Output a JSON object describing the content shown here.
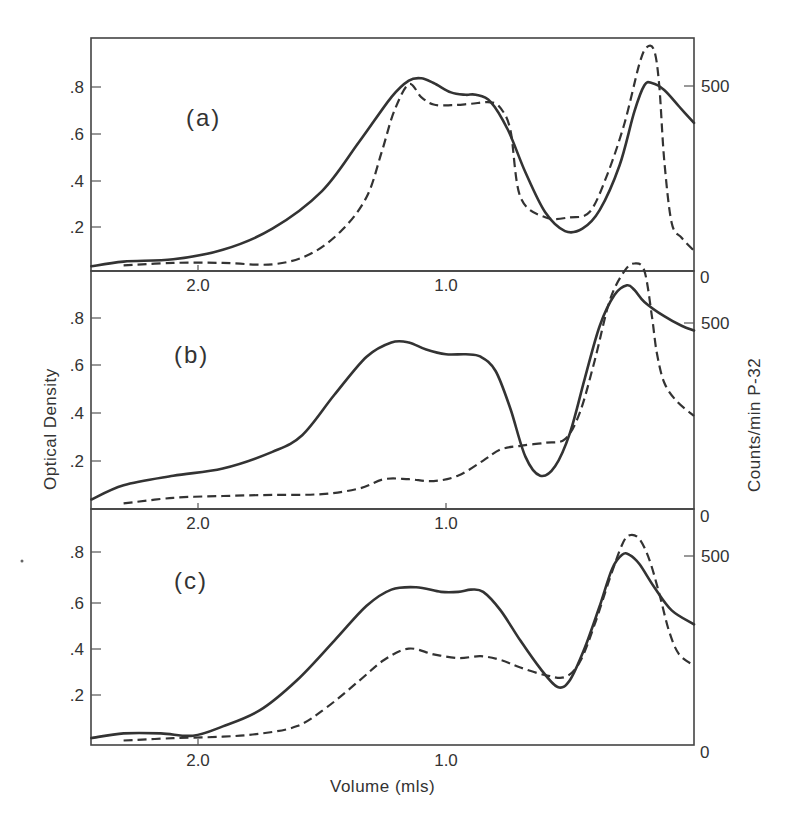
{
  "figure": {
    "y_axis_left_title": "Optical Density",
    "y_axis_right_title": "Counts/min  P-32",
    "x_axis_title": "Volume (mls)"
  },
  "panels": [
    {
      "label": "(a)",
      "left_ticks": [
        ".2",
        ".4",
        ".6",
        ".8"
      ],
      "right_ticks": [
        "0",
        "500"
      ],
      "x_ticks": [
        "2.0",
        "1.0"
      ]
    },
    {
      "label": "(b)",
      "left_ticks": [
        ".2",
        ".4",
        ".6",
        ".8"
      ],
      "right_ticks": [
        "0",
        "500"
      ],
      "x_ticks": [
        "2.0",
        "1.0"
      ]
    },
    {
      "label": "(c)",
      "left_ticks": [
        ".2",
        ".4",
        ".6",
        ".8"
      ],
      "right_ticks": [
        "0",
        "500"
      ],
      "x_ticks": [
        "2.0",
        "1.0"
      ]
    }
  ],
  "chart_data": [
    {
      "type": "line",
      "title": "(a)",
      "xlabel": "Volume (mls)",
      "ylabel": "Optical Density",
      "ylabel_right": "Counts/min P-32",
      "x_reversed": true,
      "xlim": [
        2.43,
        0.0
      ],
      "ylim": [
        0,
        0.99
      ],
      "ylim_right": [
        0,
        640
      ],
      "grid": false,
      "series": [
        {
          "name": "Optical Density (solid)",
          "axis": "left",
          "x": [
            2.43,
            2.3,
            2.1,
            1.9,
            1.7,
            1.5,
            1.35,
            1.22,
            1.15,
            1.1,
            1.05,
            0.98,
            0.92,
            0.88,
            0.82,
            0.75,
            0.68,
            0.6,
            0.52,
            0.45,
            0.38,
            0.3,
            0.24,
            0.2,
            0.17,
            0.12,
            0.06,
            0.0
          ],
          "y": [
            0.02,
            0.04,
            0.05,
            0.09,
            0.18,
            0.34,
            0.55,
            0.74,
            0.81,
            0.82,
            0.8,
            0.76,
            0.75,
            0.75,
            0.72,
            0.6,
            0.42,
            0.25,
            0.17,
            0.18,
            0.26,
            0.45,
            0.68,
            0.79,
            0.8,
            0.77,
            0.7,
            0.63
          ]
        },
        {
          "name": "Counts/min P-32 (dashed)",
          "axis": "right",
          "x": [
            2.3,
            2.1,
            1.9,
            1.7,
            1.55,
            1.42,
            1.32,
            1.26,
            1.21,
            1.15,
            1.1,
            1.05,
            0.98,
            0.9,
            0.82,
            0.78,
            0.74,
            0.7,
            0.6,
            0.5,
            0.42,
            0.35,
            0.28,
            0.22,
            0.19,
            0.16,
            0.14,
            0.12,
            0.09,
            0.05,
            0.0
          ],
          "y": [
            15,
            22,
            22,
            18,
            45,
            110,
            200,
            320,
            430,
            505,
            470,
            450,
            448,
            452,
            456,
            440,
            380,
            200,
            145,
            145,
            160,
            260,
            400,
            560,
            605,
            595,
            500,
            300,
            130,
            90,
            55
          ]
        }
      ]
    },
    {
      "type": "line",
      "title": "(b)",
      "xlabel": "Volume (mls)",
      "ylabel": "Optical Density",
      "ylabel_right": "Counts/min P-32",
      "x_reversed": true,
      "xlim": [
        2.43,
        0.0
      ],
      "ylim": [
        0,
        0.99
      ],
      "ylim_right": [
        0,
        640
      ],
      "grid": false,
      "series": [
        {
          "name": "Optical Density (solid)",
          "axis": "left",
          "x": [
            2.43,
            2.3,
            2.1,
            1.9,
            1.7,
            1.58,
            1.45,
            1.32,
            1.22,
            1.15,
            1.08,
            1.0,
            0.92,
            0.86,
            0.8,
            0.74,
            0.68,
            0.62,
            0.56,
            0.5,
            0.44,
            0.38,
            0.32,
            0.27,
            0.24,
            0.2,
            0.12,
            0.05,
            0.0
          ],
          "y": [
            0.04,
            0.1,
            0.14,
            0.17,
            0.24,
            0.31,
            0.48,
            0.64,
            0.7,
            0.7,
            0.67,
            0.65,
            0.65,
            0.64,
            0.58,
            0.42,
            0.22,
            0.14,
            0.18,
            0.32,
            0.55,
            0.77,
            0.9,
            0.94,
            0.92,
            0.87,
            0.81,
            0.77,
            0.75
          ]
        },
        {
          "name": "Counts/min P-32 (dashed)",
          "axis": "right",
          "x": [
            2.3,
            2.1,
            1.9,
            1.7,
            1.5,
            1.35,
            1.25,
            1.15,
            1.05,
            0.95,
            0.85,
            0.78,
            0.7,
            0.6,
            0.52,
            0.46,
            0.4,
            0.34,
            0.28,
            0.24,
            0.2,
            0.17,
            0.15,
            0.12,
            0.07,
            0.0
          ],
          "y": [
            15,
            30,
            35,
            38,
            40,
            55,
            80,
            80,
            75,
            90,
            130,
            160,
            170,
            178,
            188,
            260,
            400,
            560,
            640,
            660,
            640,
            520,
            420,
            340,
            290,
            250
          ]
        }
      ]
    },
    {
      "type": "line",
      "title": "(c)",
      "xlabel": "Volume (mls)",
      "ylabel": "Optical Density",
      "ylabel_right": "Counts/min P-32",
      "x_reversed": true,
      "xlim": [
        2.43,
        0.0
      ],
      "ylim": [
        0,
        0.99
      ],
      "ylim_right": [
        0,
        640
      ],
      "grid": false,
      "series": [
        {
          "name": "Optical Density (solid)",
          "axis": "left",
          "x": [
            2.43,
            2.3,
            2.15,
            2.02,
            1.9,
            1.75,
            1.6,
            1.45,
            1.32,
            1.22,
            1.12,
            1.02,
            0.95,
            0.9,
            0.85,
            0.78,
            0.7,
            0.62,
            0.55,
            0.5,
            0.44,
            0.38,
            0.33,
            0.29,
            0.26,
            0.22,
            0.16,
            0.09,
            0.0
          ],
          "y": [
            0.03,
            0.05,
            0.05,
            0.04,
            0.08,
            0.15,
            0.28,
            0.45,
            0.6,
            0.67,
            0.68,
            0.66,
            0.66,
            0.67,
            0.66,
            0.58,
            0.45,
            0.33,
            0.25,
            0.28,
            0.42,
            0.6,
            0.76,
            0.82,
            0.82,
            0.78,
            0.68,
            0.58,
            0.52
          ]
        },
        {
          "name": "Counts/min P-32 (dashed)",
          "axis": "right",
          "x": [
            2.3,
            2.1,
            1.9,
            1.75,
            1.6,
            1.48,
            1.35,
            1.25,
            1.15,
            1.05,
            0.95,
            0.86,
            0.78,
            0.7,
            0.6,
            0.52,
            0.46,
            0.4,
            0.34,
            0.29,
            0.26,
            0.22,
            0.18,
            0.14,
            0.1,
            0.06,
            0.0
          ],
          "y": [
            12,
            18,
            22,
            30,
            50,
            100,
            170,
            225,
            255,
            240,
            230,
            235,
            225,
            205,
            185,
            180,
            220,
            320,
            440,
            530,
            555,
            545,
            490,
            400,
            300,
            240,
            210
          ]
        }
      ]
    }
  ]
}
